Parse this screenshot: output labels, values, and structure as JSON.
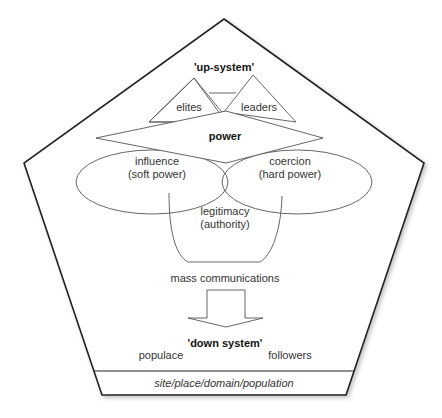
{
  "diagram": {
    "title_top": "'up-system'",
    "triangles": [
      {
        "label": "elites"
      },
      {
        "label": "leaders"
      }
    ],
    "power": {
      "label": "power"
    },
    "ellipses": [
      {
        "line1": "influence",
        "line2": "(soft power)"
      },
      {
        "line1": "coercion",
        "line2": "(hard power)"
      }
    ],
    "cup": {
      "line1": "legitimacy",
      "line2": "(authority)"
    },
    "mass_comms": "mass communications",
    "title_bottom": "'down system'",
    "bottom_left": "populace",
    "bottom_right": "followers",
    "base_band": "site/place/domain/population",
    "colors": {
      "outline": "#222222",
      "inner_lines": "#555555",
      "text": "#333333"
    }
  }
}
